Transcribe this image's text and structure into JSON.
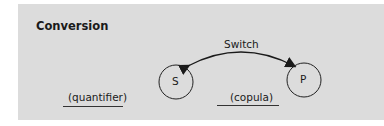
{
  "title": "Conversion",
  "arrow_label": "Switch",
  "nodes": [
    {
      "id": "S",
      "label": "S"
    },
    {
      "id": "P",
      "label": "P"
    }
  ],
  "blanks": [
    {
      "label": "(quantifier)"
    },
    {
      "label": "(copula)"
    }
  ],
  "colors": {
    "panel": "#dcdcdc",
    "ink": "#1a1a1a"
  }
}
